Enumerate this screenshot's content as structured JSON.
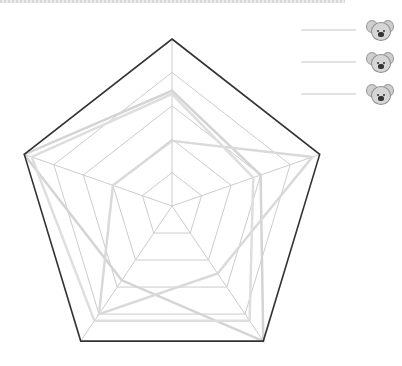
{
  "chart_data": {
    "type": "radar",
    "title": "",
    "axes": [
      "",
      "",
      "",
      "",
      ""
    ],
    "grid_levels": [
      0.2,
      0.4,
      0.6,
      0.8,
      1.0
    ],
    "range": [
      0,
      1
    ],
    "series": [
      {
        "name": "",
        "icon": "koala-emoji",
        "color": "#d4d4d4",
        "values": [
          0.69,
          0.6,
          1.0,
          0.55,
          1.0
        ]
      },
      {
        "name": "",
        "icon": "koala-emoji",
        "color": "#d9d9d9",
        "values": [
          0.39,
          0.95,
          0.5,
          0.8,
          0.4
        ]
      },
      {
        "name": "",
        "icon": "koala-emoji",
        "color": "#dedede",
        "values": [
          0.67,
          0.55,
          0.85,
          0.85,
          0.95
        ]
      }
    ],
    "legend_position": "top-right",
    "grid": true,
    "outer_border_color": "#333333",
    "grid_color": "#cccccc"
  },
  "legend": {
    "items": [
      {
        "icon": "koala-emoji"
      },
      {
        "icon": "koala-emoji"
      },
      {
        "icon": "koala-emoji"
      }
    ]
  }
}
